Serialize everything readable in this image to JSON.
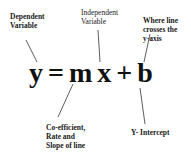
{
  "equation": {
    "y": "y",
    "equals": "=",
    "m": "m",
    "x": "x",
    "plus": "+",
    "b": "b"
  },
  "labels": {
    "dependent": "Dependent\nVariable",
    "independent": "Independent\nVariable",
    "crosses": "Where line\ncrosses the\ny-axis",
    "coefficient": "Co-efficient,\nRate and\nSlope of line",
    "intercept": "Y- Intercept"
  },
  "colors": {
    "text": "#111111",
    "line": "#333333",
    "background": "#ffffff"
  }
}
